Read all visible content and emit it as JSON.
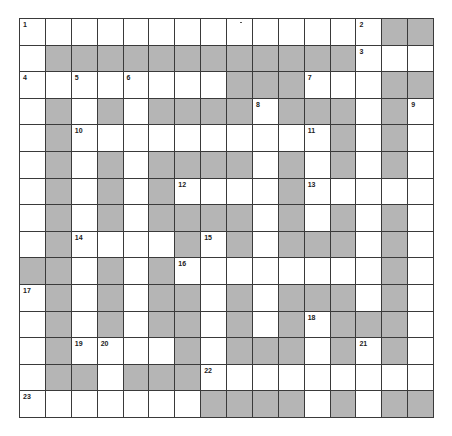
{
  "puzzle": {
    "type": "crossword",
    "rows": 15,
    "cols": 16,
    "colors": {
      "white": "#ffffff",
      "block": "#b5b5b5",
      "grid_line": "#3a3a3a",
      "number": "#222222"
    },
    "legend": {
      "W": "open cell",
      "G": "shaded block"
    },
    "grid": [
      "WWWWWWWWWWWWWWGG",
      "WGGGGGGGGGGGGWWW",
      "WWWWWWWWGGGWWWGG",
      "WGWGWGGGGWGGGWGW",
      "WGWWWWWWWWWWGWGW",
      "WGWGWGGGGWGWGWGW",
      "WGWGWGWWWWGWWWWW",
      "WGWGWGGGGWGWGWGW",
      "WGWWWWGWGWGGGWGW",
      "GGWGWGWWWWWWWWGW",
      "WGWGWGGWGWGGGWGW",
      "WGWGWGGWGWGWGGGW",
      "WGWWWWGWGGGWGWGW",
      "WGGWGGGWWWWWWWWW",
      "WWWWWWWGGGGWGWGG"
    ],
    "numbers": [
      {
        "n": "1",
        "r": 0,
        "c": 0
      },
      {
        "n": "2",
        "r": 0,
        "c": 13
      },
      {
        "n": "3",
        "r": 1,
        "c": 13
      },
      {
        "n": "4",
        "r": 2,
        "c": 0
      },
      {
        "n": "5",
        "r": 2,
        "c": 2
      },
      {
        "n": "6",
        "r": 2,
        "c": 4
      },
      {
        "n": "7",
        "r": 2,
        "c": 11
      },
      {
        "n": "8",
        "r": 3,
        "c": 9
      },
      {
        "n": "9",
        "r": 3,
        "c": 15
      },
      {
        "n": "10",
        "r": 4,
        "c": 2
      },
      {
        "n": "11",
        "r": 4,
        "c": 11
      },
      {
        "n": "12",
        "r": 6,
        "c": 6
      },
      {
        "n": "13",
        "r": 6,
        "c": 11
      },
      {
        "n": "14",
        "r": 8,
        "c": 2
      },
      {
        "n": "15",
        "r": 8,
        "c": 7
      },
      {
        "n": "16",
        "r": 9,
        "c": 6
      },
      {
        "n": "17",
        "r": 10,
        "c": 0
      },
      {
        "n": "18",
        "r": 11,
        "c": 11
      },
      {
        "n": "19",
        "r": 12,
        "c": 2
      },
      {
        "n": "20",
        "r": 12,
        "c": 3
      },
      {
        "n": "21",
        "r": 12,
        "c": 13
      },
      {
        "n": "22",
        "r": 13,
        "c": 7
      },
      {
        "n": "23",
        "r": 14,
        "c": 0
      }
    ]
  }
}
